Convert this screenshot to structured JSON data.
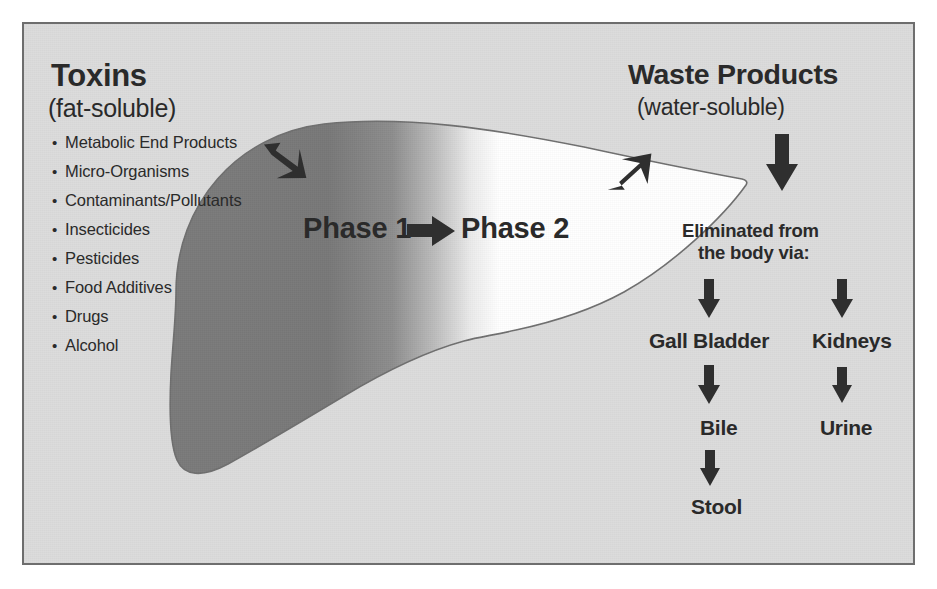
{
  "figure": {
    "type": "liver-detoxification-diagram",
    "background_color": "#dcdcdc",
    "frame_border_color": "#6e6e6e",
    "ink_color": "#2a2a2a",
    "liver_dark_color": "#757575",
    "liver_light_color": "#ffffff"
  },
  "left": {
    "title": "Toxins",
    "subtitle": "(fat-soluble)",
    "items": [
      "Metabolic End Products",
      "Micro-Organisms",
      "Contaminants/Pollutants",
      "Insecticides",
      "Pesticides",
      "Food Additives",
      "Drugs",
      "Alcohol"
    ]
  },
  "center": {
    "phase1": "Phase 1",
    "phase2": "Phase 2"
  },
  "right": {
    "title": "Waste Products",
    "subtitle": "(water-soluble)",
    "eliminated_line1": "Eliminated from",
    "eliminated_line2": "the body via:",
    "branch_bile": {
      "organ": "Gall Bladder",
      "product": "Bile",
      "output": "Stool"
    },
    "branch_urine": {
      "organ": "Kidneys",
      "product": "Urine"
    }
  },
  "icons": {
    "inflow_arrow": "arrow-down-right-icon",
    "outflow_arrow": "arrow-up-right-icon",
    "phase_arrow": "arrow-right-icon",
    "waste_arrow": "arrow-down-icon",
    "gall_arrow": "arrow-down-icon",
    "kidney_arrow": "arrow-down-icon",
    "bile_arrow": "arrow-down-icon",
    "urine_arrow": "arrow-down-icon",
    "stool_arrow": "arrow-down-icon"
  }
}
